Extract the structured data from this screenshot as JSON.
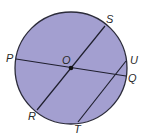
{
  "diagram": {
    "circle": {
      "cx": 71,
      "cy": 68,
      "r": 56,
      "fill": "#a39fd0",
      "stroke": "#2b2b3a"
    },
    "center": {
      "label": "O",
      "x": 71,
      "y": 68
    },
    "points": {
      "P": {
        "label": "P",
        "x": 16,
        "y": 59
      },
      "Q": {
        "label": "Q",
        "x": 126,
        "y": 76
      },
      "S": {
        "label": "S",
        "x": 105,
        "y": 26
      },
      "R": {
        "label": "R",
        "x": 37,
        "y": 110
      },
      "U": {
        "label": "U",
        "x": 126,
        "y": 61
      },
      "T": {
        "label": "T",
        "x": 78,
        "y": 122
      }
    },
    "segments": [
      {
        "name": "diameter-PQ",
        "from": "P",
        "to": "Q"
      },
      {
        "name": "diameter-SR",
        "from": "S",
        "to": "R"
      },
      {
        "name": "chord-UT",
        "from": "U",
        "to": "T"
      }
    ]
  }
}
